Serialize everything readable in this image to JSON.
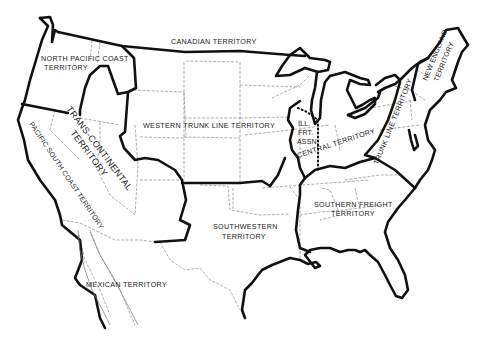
{
  "map": {
    "subject": "United States freight rate territories",
    "territories": [
      {
        "id": "canadian",
        "label": "CANADIAN TERRITORY"
      },
      {
        "id": "north-pacific-coast",
        "label_lines": [
          "NORTH PACIFIC COAST",
          "TERRITORY"
        ]
      },
      {
        "id": "trans-continental",
        "label_lines": [
          "TRANS-CONTINENTAL",
          "TERRITORY"
        ]
      },
      {
        "id": "pacific-south-coast",
        "label": "PACIFIC SOUTH COAST TERRITORY"
      },
      {
        "id": "western-trunk-line",
        "label": "WESTERN TRUNK LINE TERRITORY"
      },
      {
        "id": "southwestern",
        "label_lines": [
          "SOUTHWESTERN",
          "TERRITORY"
        ]
      },
      {
        "id": "mexican",
        "label": "MEXICAN TERRITORY"
      },
      {
        "id": "ill-frt-assn",
        "label_lines": [
          "ILL.",
          "FRT.",
          "ASSN."
        ]
      },
      {
        "id": "central",
        "label": "CENTRAL TERRITORY"
      },
      {
        "id": "trunk-line",
        "label": "TRUNK LINE TERRITORY"
      },
      {
        "id": "new-england",
        "label_lines": [
          "NEW ENGLAND",
          "TERRITORY"
        ]
      },
      {
        "id": "southern-freight",
        "label_lines": [
          "SOUTHERN FREIGHT",
          "TERRITORY"
        ]
      }
    ]
  }
}
